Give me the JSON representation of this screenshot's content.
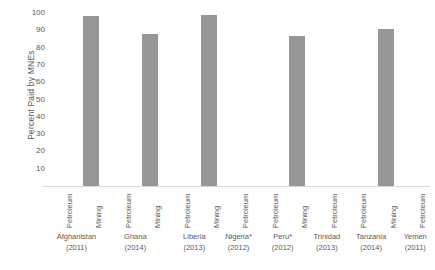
{
  "chart_data": {
    "type": "bar",
    "title": "",
    "xlabel": "",
    "ylabel": "Percent Paid by MNEs",
    "ylim": [
      0,
      100
    ],
    "ytick_labels": [
      "100",
      "90",
      "80",
      "70",
      "60",
      "50",
      "40",
      "30",
      "20",
      "10",
      "-"
    ],
    "ytick_values": [
      100,
      90,
      80,
      70,
      60,
      50,
      40,
      30,
      20,
      10,
      0
    ],
    "grid": false,
    "legend": "none",
    "bar_color": "#969696",
    "text_color": "#5a5a5a",
    "axis_color": "#d9d9d9",
    "categories": [
      "Petroleum",
      "Mining",
      "Petroleum",
      "Mining",
      "Petroleum",
      "Mining",
      "Petroleum",
      "Petroleum",
      "Mining",
      "Petroleum",
      "Petroleum",
      "Mining",
      "Petroleum"
    ],
    "values": [
      0,
      98,
      0,
      88,
      0,
      99,
      0,
      0,
      87,
      0,
      0,
      91,
      0
    ],
    "groups": [
      {
        "country": "Afghanistan",
        "year": "(2011)",
        "span": 2
      },
      {
        "country": "Ghana",
        "year": "(2014)",
        "span": 2
      },
      {
        "country": "Liberia",
        "year": "(2013)",
        "span": 2
      },
      {
        "country": "Nigeria*",
        "year": "(2012)",
        "span": 1
      },
      {
        "country": "Peru*",
        "year": "(2012)",
        "span": 2
      },
      {
        "country": "Trinidad",
        "year": "(2013)",
        "span": 1
      },
      {
        "country": "Tanzania",
        "year": "(2014)",
        "span": 2
      },
      {
        "country": "Yemen",
        "year": "(2011)",
        "span": 1
      }
    ]
  }
}
